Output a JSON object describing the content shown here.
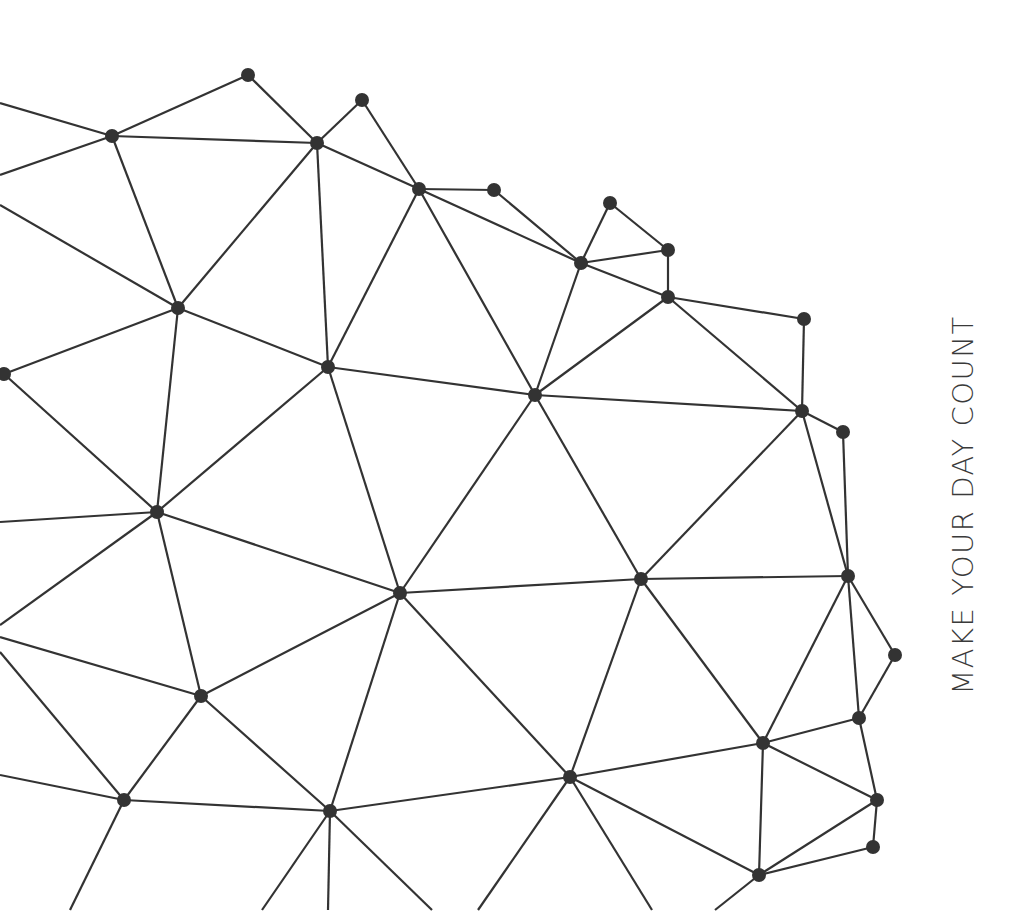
{
  "tagline": "MAKE YOUR DAY COUNT",
  "colors": {
    "background": "#ffffff",
    "line": "#333333",
    "node": "#333333",
    "text": "#3a3a3a"
  },
  "network": {
    "node_radius": 7,
    "nodes": {
      "A": [
        248,
        75
      ],
      "B": [
        362,
        100
      ],
      "C": [
        112,
        136
      ],
      "D": [
        317,
        143
      ],
      "E": [
        419,
        189
      ],
      "F": [
        494,
        190
      ],
      "G": [
        610,
        203
      ],
      "H": [
        668,
        250
      ],
      "I": [
        581,
        263
      ],
      "J": [
        668,
        297
      ],
      "K": [
        804,
        319
      ],
      "L": [
        178,
        308
      ],
      "M": [
        328,
        367
      ],
      "N": [
        535,
        395
      ],
      "O": [
        802,
        411
      ],
      "P": [
        843,
        432
      ],
      "Q": [
        4,
        374
      ],
      "R": [
        157,
        512
      ],
      "S": [
        400,
        593
      ],
      "T": [
        641,
        579
      ],
      "U": [
        848,
        576
      ],
      "V": [
        895,
        655
      ],
      "W": [
        201,
        696
      ],
      "X": [
        859,
        718
      ],
      "Y": [
        763,
        743
      ],
      "Z": [
        570,
        777
      ],
      "AA": [
        124,
        800
      ],
      "AB": [
        330,
        811
      ],
      "AC": [
        877,
        800
      ],
      "AD": [
        873,
        847
      ],
      "AE": [
        759,
        875
      ]
    },
    "edge_stubs": [
      [
        [
          0,
          103
        ],
        "C"
      ],
      [
        [
          0,
          175
        ],
        "C"
      ],
      [
        [
          0,
          205
        ],
        "L"
      ],
      [
        [
          0,
          522
        ],
        "R"
      ],
      [
        [
          0,
          625
        ],
        "R"
      ],
      [
        [
          0,
          637
        ],
        "W"
      ],
      [
        [
          0,
          652
        ],
        "AA"
      ],
      [
        [
          0,
          775
        ],
        "AA"
      ],
      [
        [
          70,
          910
        ],
        "AA"
      ],
      [
        [
          262,
          910
        ],
        "AB"
      ],
      [
        [
          328,
          910
        ],
        "AB"
      ],
      [
        [
          432,
          910
        ],
        "AB"
      ],
      [
        [
          478,
          910
        ],
        "Z"
      ],
      [
        [
          652,
          910
        ],
        "Z"
      ],
      [
        [
          715,
          910
        ],
        "AE"
      ]
    ],
    "edges": [
      [
        "A",
        "C"
      ],
      [
        "A",
        "D"
      ],
      [
        "C",
        "D"
      ],
      [
        "B",
        "D"
      ],
      [
        "B",
        "E"
      ],
      [
        "C",
        "L"
      ],
      [
        "D",
        "L"
      ],
      [
        "D",
        "M"
      ],
      [
        "D",
        "E"
      ],
      [
        "E",
        "F"
      ],
      [
        "E",
        "M"
      ],
      [
        "E",
        "N"
      ],
      [
        "E",
        "I"
      ],
      [
        "F",
        "I"
      ],
      [
        "G",
        "I"
      ],
      [
        "G",
        "H"
      ],
      [
        "H",
        "I"
      ],
      [
        "H",
        "J"
      ],
      [
        "I",
        "J"
      ],
      [
        "I",
        "N"
      ],
      [
        "J",
        "N"
      ],
      [
        "J",
        "K"
      ],
      [
        "J",
        "O"
      ],
      [
        "K",
        "O"
      ],
      [
        "L",
        "M"
      ],
      [
        "L",
        "Q"
      ],
      [
        "L",
        "R"
      ],
      [
        "M",
        "N"
      ],
      [
        "M",
        "R"
      ],
      [
        "M",
        "S"
      ],
      [
        "N",
        "O"
      ],
      [
        "N",
        "S"
      ],
      [
        "N",
        "T"
      ],
      [
        "O",
        "P"
      ],
      [
        "O",
        "T"
      ],
      [
        "O",
        "U"
      ],
      [
        "P",
        "U"
      ],
      [
        "Q",
        "R"
      ],
      [
        "R",
        "S"
      ],
      [
        "R",
        "W"
      ],
      [
        "S",
        "T"
      ],
      [
        "S",
        "W"
      ],
      [
        "S",
        "Z"
      ],
      [
        "S",
        "AB"
      ],
      [
        "T",
        "U"
      ],
      [
        "T",
        "Y"
      ],
      [
        "T",
        "Z"
      ],
      [
        "U",
        "V"
      ],
      [
        "U",
        "X"
      ],
      [
        "U",
        "Y"
      ],
      [
        "V",
        "X"
      ],
      [
        "W",
        "AA"
      ],
      [
        "W",
        "AB"
      ],
      [
        "X",
        "Y"
      ],
      [
        "X",
        "AC"
      ],
      [
        "Y",
        "AC"
      ],
      [
        "Y",
        "Z"
      ],
      [
        "Y",
        "AE"
      ],
      [
        "Z",
        "AB"
      ],
      [
        "Z",
        "AE"
      ],
      [
        "AA",
        "AB"
      ],
      [
        "AC",
        "AD"
      ],
      [
        "AC",
        "AE"
      ],
      [
        "AD",
        "AE"
      ]
    ]
  }
}
